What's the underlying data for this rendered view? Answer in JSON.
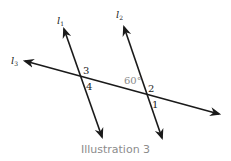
{
  "diagram": {
    "caption": "Illustration 3",
    "lines": [
      {
        "id": "l1",
        "name": "l",
        "subscript": "1"
      },
      {
        "id": "l2",
        "name": "l",
        "subscript": "2"
      },
      {
        "id": "l3",
        "name": "l",
        "subscript": "3"
      }
    ],
    "angle_labels": {
      "a3": "3",
      "a4": "4",
      "a2": "2",
      "a1": "1",
      "given": "60°"
    },
    "colors": {
      "line": "#1a1a1a",
      "label": "#222222",
      "angle_given": "#8a8a8a",
      "caption": "#8c8c8c"
    }
  }
}
